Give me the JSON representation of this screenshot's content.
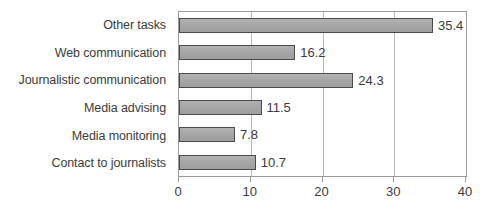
{
  "chart_data": {
    "type": "bar",
    "orientation": "horizontal",
    "title": "",
    "subtitle": "",
    "xlabel": "",
    "ylabel": "",
    "categories": [
      "Other tasks",
      "Web communication",
      "Journalistic communication",
      "Media advising",
      "Media monitoring",
      "Contact to journalists"
    ],
    "values": [
      35.4,
      16.2,
      24.3,
      11.5,
      7.8,
      10.7
    ],
    "value_labels": [
      "35.4",
      "16.2",
      "24.3",
      "11.5",
      "7.8",
      "10.7"
    ],
    "xlim": [
      0,
      40
    ],
    "xticks": [
      0,
      10,
      20,
      30,
      40
    ],
    "xtick_labels": [
      "0",
      "10",
      "20",
      "30",
      "40"
    ],
    "grid": true,
    "grid_axis": "x",
    "legend": false,
    "legend_position": "none",
    "bar_color": "#a8a8a8",
    "bar_border_color": "#4a4a4a",
    "axis_color": "#9a9a9a",
    "grid_color": "#b9b9b9",
    "text_color": "#3b3b3b",
    "background_color": "#ffffff"
  }
}
